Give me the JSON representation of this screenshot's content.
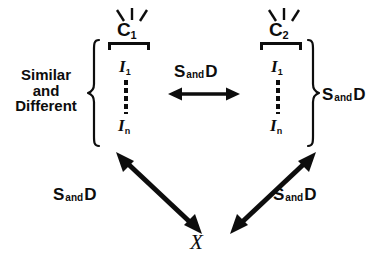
{
  "figure": {
    "name": "similar-and-different-concept-diagram",
    "background_color": "#ffffff",
    "ink_color": "#0d0d0d"
  },
  "left_caption": {
    "line1": "Similar",
    "line2": "and",
    "line3": "Different"
  },
  "columns": [
    {
      "id": "left",
      "concept_label": "C",
      "concept_subscript": "1",
      "instance_top_label": "I",
      "instance_top_subscript": "1",
      "instance_bottom_label": "I",
      "instance_bottom_subscript": "n"
    },
    {
      "id": "right",
      "concept_label": "C",
      "concept_subscript": "2",
      "instance_top_label": "I",
      "instance_top_subscript": "1",
      "instance_bottom_label": "I",
      "instance_bottom_subscript": "n"
    }
  ],
  "relations": {
    "prefix": "S",
    "conjunction": "and",
    "suffix": "D",
    "center_label": "S and D",
    "right_label": "S and D",
    "lower_left_label": "S and D",
    "lower_right_label": "S and D"
  },
  "target_node": {
    "label": "X"
  },
  "braces": {
    "left": "{",
    "right": "}"
  }
}
